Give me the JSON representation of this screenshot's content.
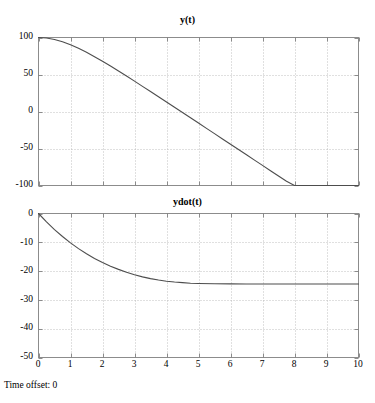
{
  "figure": {
    "background_color": "#ffffff",
    "axes_color": "#808080",
    "grid_color": "#b0b0b0",
    "line_color": "#4d4d4d",
    "status_text": "Time offset: 0"
  },
  "chart_data": [
    {
      "type": "line",
      "title": "y(t)",
      "xlabel": "",
      "ylabel": "",
      "xlim": [
        0,
        10
      ],
      "ylim": [
        -100,
        100
      ],
      "xticks": [
        0,
        1,
        2,
        3,
        4,
        5,
        6,
        7,
        8,
        9,
        10
      ],
      "xticklabels": [
        "0",
        "1",
        "2",
        "3",
        "4",
        "5",
        "6",
        "7",
        "8",
        "9",
        "10"
      ],
      "yticks": [
        -100,
        -50,
        0,
        50,
        100
      ],
      "yticklabels": [
        "-100",
        "-50",
        "0",
        "50",
        "100"
      ],
      "grid": true,
      "legend": null,
      "series": [
        {
          "name": "y(t)",
          "x": [
            0,
            0.25,
            0.5,
            0.75,
            1,
            1.25,
            1.5,
            1.75,
            2,
            2.25,
            2.5,
            2.75,
            3,
            3.25,
            3.5,
            3.75,
            4,
            4.25,
            4.5,
            4.75,
            5,
            5.25,
            5.5,
            5.75,
            6,
            6.25,
            6.5,
            6.75,
            7,
            7.25,
            7.5,
            7.75,
            8,
            8.25,
            8.5,
            8.75,
            9,
            9.25,
            9.5,
            9.75,
            10
          ],
          "values": [
            100,
            99.3,
            97.3,
            94.2,
            90.2,
            85.4,
            80.0,
            74.1,
            67.9,
            61.4,
            54.7,
            47.9,
            41.0,
            34.0,
            27.0,
            19.9,
            12.8,
            5.7,
            -1.4,
            -8.5,
            -15.6,
            -22.8,
            -29.9,
            -37.1,
            -44.2,
            -51.4,
            -58.5,
            -65.7,
            -72.8,
            -80.0,
            -87.2,
            -94.3,
            -100,
            -100,
            -100,
            -100,
            -100,
            -100,
            -100,
            -100,
            -100
          ]
        }
      ]
    },
    {
      "type": "line",
      "title": "ydot(t)",
      "xlabel": "",
      "ylabel": "",
      "xlim": [
        0,
        10
      ],
      "ylim": [
        -50,
        0
      ],
      "xticks": [
        0,
        1,
        2,
        3,
        4,
        5,
        6,
        7,
        8,
        9,
        10
      ],
      "xticklabels": [
        "0",
        "1",
        "2",
        "3",
        "4",
        "5",
        "6",
        "7",
        "8",
        "9",
        "10"
      ],
      "yticks": [
        -50,
        -40,
        -30,
        -20,
        -10,
        0
      ],
      "yticklabels": [
        "-50",
        "-40",
        "-30",
        "-20",
        "-10",
        "0"
      ],
      "grid": true,
      "legend": null,
      "series": [
        {
          "name": "ydot(t)",
          "x": [
            0,
            0.25,
            0.5,
            0.75,
            1,
            1.25,
            1.5,
            1.75,
            2,
            2.25,
            2.5,
            2.75,
            3,
            3.25,
            3.5,
            3.75,
            4,
            4.25,
            4.5,
            4.75,
            5,
            5.5,
            6,
            6.5,
            7,
            7.5,
            8,
            8.5,
            9,
            9.5,
            10
          ],
          "values": [
            0,
            -2.9,
            -5.6,
            -8.0,
            -10.2,
            -12.2,
            -14.0,
            -15.6,
            -17.0,
            -18.3,
            -19.4,
            -20.4,
            -21.3,
            -22.0,
            -22.6,
            -23.1,
            -23.5,
            -23.8,
            -24.0,
            -24.2,
            -24.3,
            -24.4,
            -24.45,
            -24.48,
            -24.5,
            -24.5,
            -24.5,
            -24.5,
            -24.5,
            -24.5,
            -24.5
          ]
        }
      ]
    }
  ],
  "plots": {
    "top": {
      "title": "y(t)",
      "yticklabels": [
        "100",
        "50",
        "0",
        "-50",
        "-100"
      ]
    },
    "bottom": {
      "title": "ydot(t)",
      "yticklabels": [
        "0",
        "-10",
        "-20",
        "-30",
        "-40",
        "-50"
      ],
      "xticklabels": [
        "0",
        "1",
        "2",
        "3",
        "4",
        "5",
        "6",
        "7",
        "8",
        "9",
        "10"
      ]
    }
  }
}
